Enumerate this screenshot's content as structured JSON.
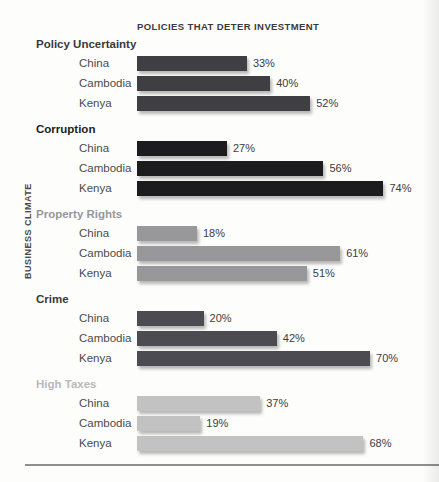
{
  "chart_data": {
    "type": "bar",
    "orientation": "horizontal",
    "title": "POLICIES THAT DETER INVESTMENT",
    "ylabel": "BUSINESS CLIMATE",
    "xlabel": "",
    "unit": "%",
    "xlim": [
      0,
      100
    ],
    "grid": false,
    "legend": "none",
    "categories": [
      "China",
      "Cambodia",
      "Kenya"
    ],
    "px_per_percent": 3.33,
    "groups": [
      {
        "label": "Policy Uncertainty",
        "bar_color": "#3e3e43",
        "label_color": "#39393d",
        "values": [
          33,
          40,
          52
        ],
        "value_labels": [
          "33%",
          "40%",
          "52%"
        ]
      },
      {
        "label": "Corruption",
        "bar_color": "#1c1c1e",
        "label_color": "#1d1d1f",
        "values": [
          27,
          56,
          74
        ],
        "value_labels": [
          "27%",
          "56%",
          "74%"
        ]
      },
      {
        "label": "Property Rights",
        "bar_color": "#98989a",
        "label_color": "#97979a",
        "values": [
          18,
          61,
          51
        ],
        "value_labels": [
          "18%",
          "61%",
          "51%"
        ]
      },
      {
        "label": "Crime",
        "bar_color": "#4b4b51",
        "label_color": "#39393d",
        "values": [
          20,
          42,
          70
        ],
        "value_labels": [
          "20%",
          "42%",
          "70%"
        ]
      },
      {
        "label": "High Taxes",
        "bar_color": "#c2c2c2",
        "label_color": "#b9b9b9",
        "values": [
          37,
          19,
          68
        ],
        "value_labels": [
          "37%",
          "19%",
          "68%"
        ]
      }
    ]
  }
}
